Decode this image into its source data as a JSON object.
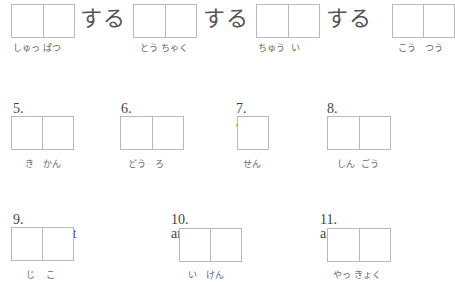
{
  "row1": {
    "suffix": "する",
    "items": [
      {
        "reading": "しゅっ ぱつ",
        "cells": 2
      },
      {
        "reading": "とう ちゃく",
        "cells": 2
      },
      {
        "reading": "ちゅう  い",
        "cells": 2
      },
      {
        "reading": "こう   つう",
        "cells": 2
      }
    ]
  },
  "row2": {
    "items": [
      {
        "number": "5.",
        "label": "an organ",
        "reading": "き   かん",
        "cells": 2
      },
      {
        "number": "6.",
        "label": "a road",
        "reading": "どう   ろ",
        "cells": 2
      },
      {
        "number": "7.",
        "label": "a line",
        "reading": "せん",
        "cells": 1
      },
      {
        "number": "8.",
        "label": "a signal",
        "reading": "しん  ごう",
        "cells": 2
      }
    ]
  },
  "row3": {
    "items": [
      {
        "number": "9.",
        "label": "an accident",
        "reading": "じ    こ",
        "cells": 2
      },
      {
        "number": "10.",
        "label": "an opinion",
        "reading": "い   けん",
        "cells": 2
      },
      {
        "number": "11.",
        "label": "a pharmacy",
        "reading": "やっ きょく",
        "cells": 2
      }
    ]
  }
}
